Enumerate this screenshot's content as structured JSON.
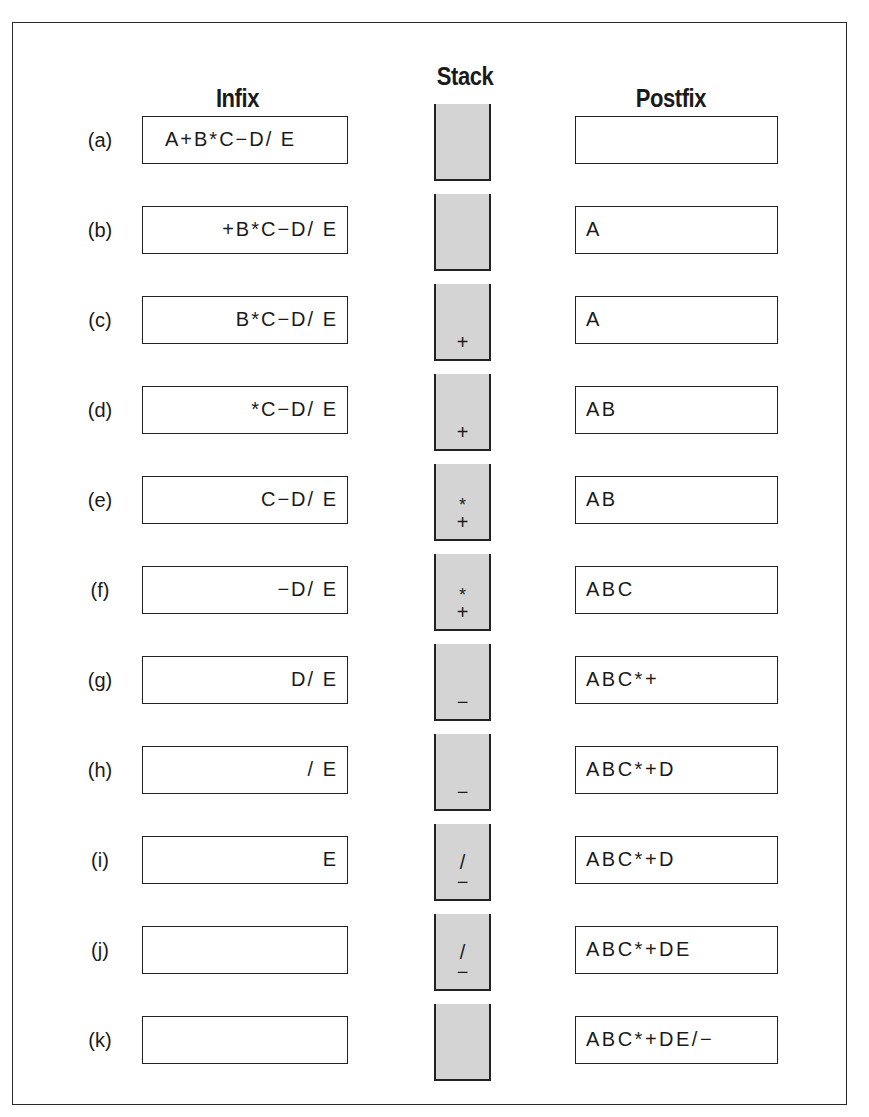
{
  "headers": {
    "infix": "Infix",
    "stack": "Stack",
    "postfix": "Postfix"
  },
  "rows": [
    {
      "label": "(a)",
      "infix": "A+B*C−D/ E",
      "infix_align": "left",
      "stack": [],
      "postfix": ""
    },
    {
      "label": "(b)",
      "infix": "+B*C−D/ E",
      "infix_align": "right",
      "stack": [],
      "postfix": "A"
    },
    {
      "label": "(c)",
      "infix": "B*C−D/ E",
      "infix_align": "right",
      "stack": [
        "+"
      ],
      "postfix": "A"
    },
    {
      "label": "(d)",
      "infix": "*C−D/ E",
      "infix_align": "right",
      "stack": [
        "+"
      ],
      "postfix": "AB"
    },
    {
      "label": "(e)",
      "infix": "C−D/ E",
      "infix_align": "right",
      "stack": [
        "*",
        "+"
      ],
      "postfix": "AB"
    },
    {
      "label": "(f)",
      "infix": "−D/ E",
      "infix_align": "right",
      "stack": [
        "*",
        "+"
      ],
      "postfix": "ABC"
    },
    {
      "label": "(g)",
      "infix": "D/ E",
      "infix_align": "right",
      "stack": [
        "−"
      ],
      "postfix": "ABC*+"
    },
    {
      "label": "(h)",
      "infix": "/ E",
      "infix_align": "right",
      "stack": [
        "−"
      ],
      "postfix": "ABC*+D"
    },
    {
      "label": "(i)",
      "infix": "E",
      "infix_align": "right",
      "stack": [
        "/",
        "−"
      ],
      "postfix": "ABC*+D"
    },
    {
      "label": "(j)",
      "infix": "",
      "infix_align": "right",
      "stack": [
        "/",
        "−"
      ],
      "postfix": "ABC*+DE"
    },
    {
      "label": "(k)",
      "infix": "",
      "infix_align": "right",
      "stack": [],
      "postfix": "ABC*+DE/−"
    }
  ]
}
